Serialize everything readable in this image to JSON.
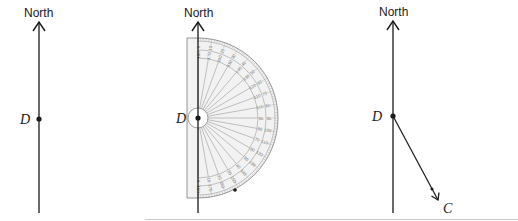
{
  "figure": {
    "colors": {
      "ink": "#1a1a1a",
      "protractor_fill": "#f2f2f2",
      "protractor_stroke": "#8a8a8a",
      "protractor_lines": "#9a9a9a",
      "bottom_rule": "#c8c8c8"
    },
    "panels": [
      {
        "id": "step-1",
        "north_label": "North",
        "point_label": "D"
      },
      {
        "id": "step-2",
        "north_label": "North",
        "point_label": "D",
        "protractor": {
          "outer_scale_start": "0",
          "inner_scale_start": "180",
          "outer_scale_labels": [
            "0",
            "10",
            "20",
            "30",
            "40",
            "50",
            "60",
            "70",
            "80",
            "90",
            "100",
            "110",
            "120",
            "130",
            "140",
            "150",
            "160",
            "170",
            "180"
          ],
          "inner_scale_labels": [
            "180",
            "170",
            "160",
            "150",
            "140",
            "130",
            "120",
            "110",
            "100",
            "90",
            "80",
            "70",
            "60",
            "50",
            "40",
            "30",
            "20",
            "10",
            "0"
          ]
        },
        "marked_point": "bearing mark"
      },
      {
        "id": "step-3",
        "north_label": "North",
        "point_label": "D",
        "end_label": "C"
      }
    ]
  }
}
